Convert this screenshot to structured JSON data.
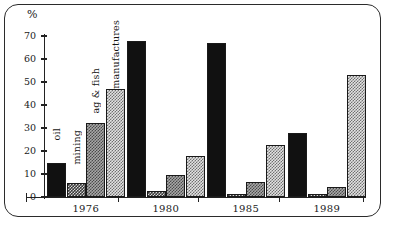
{
  "chart_data": {
    "type": "bar",
    "title": "",
    "xlabel": "",
    "ylabel": "%",
    "ylim": [
      0,
      70
    ],
    "yticks": [
      0,
      10,
      20,
      30,
      40,
      50,
      60,
      70
    ],
    "grid": false,
    "legend_position": "inline-annotations",
    "categories": [
      "1976",
      "1980",
      "1985",
      "1989"
    ],
    "series": [
      {
        "name": "oil",
        "values": [
          15,
          68,
          67,
          28
        ]
      },
      {
        "name": "mining",
        "values": [
          6,
          2.5,
          1.5,
          1.5
        ]
      },
      {
        "name": "ag & fish",
        "values": [
          32,
          9.5,
          6.5,
          4.5
        ]
      },
      {
        "name": "manufactures",
        "values": [
          47,
          18,
          22.5,
          53
        ]
      }
    ],
    "annotations": [
      "oil",
      "mining",
      "ag & fish",
      "manufactures"
    ]
  },
  "axis": {
    "y_unit_label": "%",
    "tick_labels": [
      "70",
      "60",
      "50",
      "40",
      "30",
      "20",
      "10",
      "0"
    ],
    "x_labels": [
      "1976",
      "1980",
      "1985",
      "1989"
    ]
  },
  "colors": {
    "oil": "#111111",
    "mining": "#3a3a3a",
    "ag_fish": "#a8a8a8",
    "manufactures": "#e2e2e2",
    "axis": "#222222",
    "frame": "#2b2b2b"
  }
}
